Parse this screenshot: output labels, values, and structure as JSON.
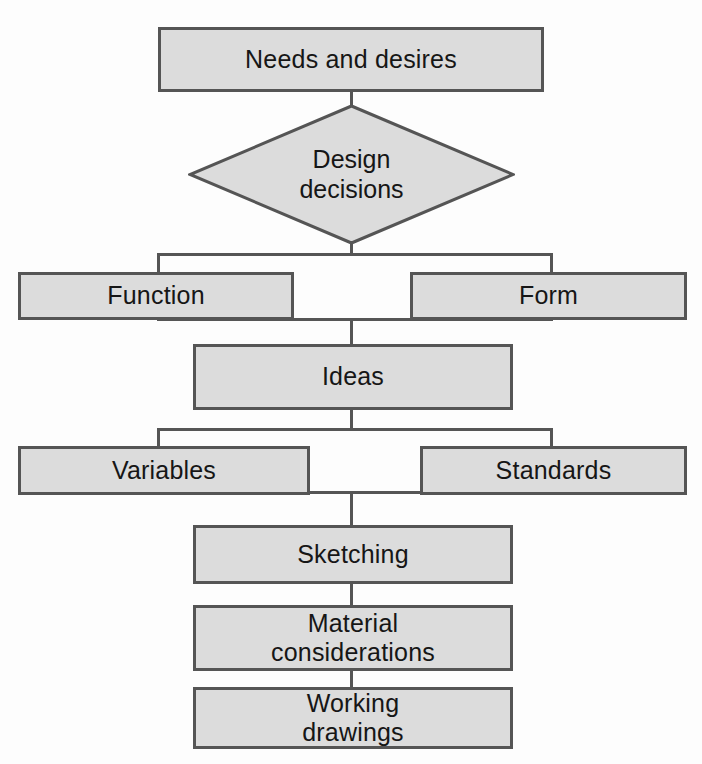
{
  "diagram": {
    "colors": {
      "node_fill": "#dcdcdc",
      "node_border": "#555555",
      "connector": "#555555",
      "background": "#fdfdfd",
      "text": "#161616"
    },
    "nodes": {
      "needs": {
        "label": "Needs and desires",
        "shape": "rectangle"
      },
      "design_decisions": {
        "label": "Design\ndecisions",
        "line1": "Design",
        "line2": "decisions",
        "shape": "diamond"
      },
      "function": {
        "label": "Function",
        "shape": "rectangle"
      },
      "form": {
        "label": "Form",
        "shape": "rectangle"
      },
      "ideas": {
        "label": "Ideas",
        "shape": "rectangle"
      },
      "variables": {
        "label": "Variables",
        "shape": "rectangle"
      },
      "standards": {
        "label": "Standards",
        "shape": "rectangle"
      },
      "sketching": {
        "label": "Sketching",
        "shape": "rectangle"
      },
      "material": {
        "line1": "Material",
        "line2": "considerations",
        "shape": "rectangle"
      },
      "working": {
        "line1": "Working",
        "line2": "drawings",
        "shape": "rectangle"
      }
    },
    "flow_order": [
      "Needs and desires",
      "Design decisions",
      "Function / Form",
      "Ideas",
      "Variables / Standards",
      "Sketching",
      "Material considerations",
      "Working drawings"
    ]
  }
}
